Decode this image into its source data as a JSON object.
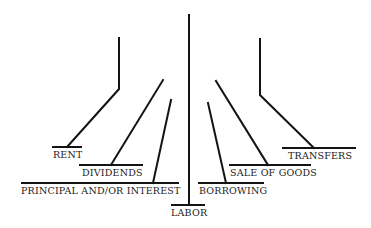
{
  "diagram": {
    "type": "income-sources-tree",
    "center": {
      "label": "LABOR"
    },
    "left_branches": [
      {
        "label": "RENT"
      },
      {
        "label": "DIVIDENDS"
      },
      {
        "label": "PRINCIPAL AND/OR INTEREST"
      }
    ],
    "right_branches": [
      {
        "label": "BORROWING"
      },
      {
        "label": "SALE OF GOODS"
      },
      {
        "label": "TRANSFERS"
      }
    ],
    "line_color": "#141414",
    "background": "#ffffff"
  }
}
